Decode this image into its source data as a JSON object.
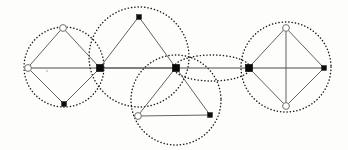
{
  "figure": {
    "background_color": "#fdfdfc",
    "width": 348,
    "height": 150,
    "stroke_colors": {
      "dotted_circle": "#1a1a1a",
      "polygon_edge": "#5a5a5a",
      "axis": "#4a4a4a",
      "node_filled": "#0d0d0d",
      "node_hollow_fill": "#ffffff",
      "node_hollow_stroke": "#6e6e6e"
    }
  },
  "circles": [
    {
      "id": "circle-left",
      "label": "left circle",
      "cx": 64,
      "cy": 67,
      "r": 40,
      "style": "dotted"
    },
    {
      "id": "circle-upper-middle",
      "label": "upper middle circle",
      "cx": 139,
      "cy": 57,
      "r": 50,
      "style": "dotted"
    },
    {
      "id": "circle-lower-middle",
      "label": "lower middle circle",
      "cx": 176,
      "cy": 100,
      "r": 45,
      "style": "dotted"
    },
    {
      "id": "circle-right",
      "label": "right circle",
      "cx": 286,
      "cy": 67,
      "r": 45,
      "style": "dotted"
    }
  ],
  "lens": {
    "id": "lens-ellipse",
    "label": "flattened dotted lens between center and right junction",
    "cx": 212,
    "cy": 68,
    "rx": 38,
    "ry": 13,
    "style": "dotted"
  },
  "nodes": [
    {
      "id": "n-left-top",
      "label": "left diamond top vertex",
      "x": 63,
      "y": 28,
      "type": "hollow",
      "r": 3.4
    },
    {
      "id": "n-left-west",
      "label": "left diamond west vertex",
      "x": 28,
      "y": 68,
      "type": "hollow",
      "r": 3.4
    },
    {
      "id": "n-left-bottom",
      "label": "left diamond bottom vertex",
      "x": 64,
      "y": 104,
      "type": "filled",
      "r": 2.8
    },
    {
      "id": "n-junction-left",
      "label": "left junction node",
      "x": 100,
      "y": 68,
      "type": "junction",
      "r": 4.1
    },
    {
      "id": "n-tri-up-apex",
      "label": "upper triangle apex",
      "x": 139,
      "y": 17,
      "type": "filled",
      "r": 2.8
    },
    {
      "id": "n-junction-mid",
      "label": "center junction node",
      "x": 176,
      "y": 68,
      "type": "junction",
      "r": 4.1
    },
    {
      "id": "n-tri-dn-left",
      "label": "lower triangle bottom-left",
      "x": 138,
      "y": 116,
      "type": "hollow",
      "r": 3.4
    },
    {
      "id": "n-tri-dn-right",
      "label": "lower triangle bottom-right",
      "x": 210,
      "y": 115,
      "type": "filled",
      "r": 2.8
    },
    {
      "id": "n-junction-right",
      "label": "right junction node",
      "x": 249,
      "y": 68,
      "type": "junction",
      "r": 4.1
    },
    {
      "id": "n-right-top",
      "label": "right diamond top vertex",
      "x": 286,
      "y": 28,
      "type": "hollow",
      "r": 3.4
    },
    {
      "id": "n-right-bottom",
      "label": "right diamond bottom vertex",
      "x": 286,
      "y": 106,
      "type": "hollow",
      "r": 3.4
    },
    {
      "id": "n-right-east",
      "label": "right diamond east vertex",
      "x": 324,
      "y": 68,
      "type": "filled",
      "r": 2.8
    }
  ],
  "polygons": [
    {
      "id": "poly-left-diamond",
      "label": "left diamond",
      "shape": "quadrilateral",
      "points": "63,28 100,68 64,104 28,68"
    },
    {
      "id": "poly-upper-triangle",
      "label": "upper triangle",
      "shape": "triangle",
      "points": "139,17 176,68 100,68"
    },
    {
      "id": "poly-lower-triangle",
      "label": "lower triangle",
      "shape": "triangle",
      "points": "176,68 210,115 138,116"
    },
    {
      "id": "poly-right-diamond",
      "label": "right diamond",
      "shape": "quadrilateral",
      "points": "286,28 324,68 286,106 249,68"
    }
  ],
  "chords": [
    {
      "id": "chord-right-vertical",
      "label": "right diamond vertical chord",
      "x1": 286,
      "y1": 28,
      "x2": 286,
      "y2": 106
    }
  ],
  "axis": {
    "id": "horizontal-axis",
    "label": "horizontal baseline through all junction nodes",
    "x1": 28,
    "y1": 68,
    "x2": 324,
    "y2": 68
  },
  "specks": [
    {
      "id": "speck-left",
      "label": "small mark inside left circle",
      "x": 47,
      "y": 71,
      "r": 0.8
    }
  ]
}
